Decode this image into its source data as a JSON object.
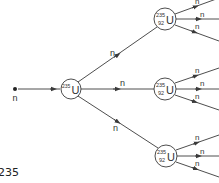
{
  "diagram": {
    "colors": {
      "line": "#3a3a3a",
      "text": "#333333",
      "background": "#ffffff"
    },
    "incoming_neutron": {
      "label": "n"
    },
    "primary_nucleus": {
      "mass": "235",
      "symbol": "U"
    },
    "branch_labels": [
      "n",
      "n",
      "n"
    ],
    "secondary_nuclei": [
      {
        "mass": "235",
        "atomic": "92",
        "symbol": "U",
        "out_labels": [
          "n",
          "n",
          "n"
        ]
      },
      {
        "mass": "235",
        "atomic": "92",
        "symbol": "U",
        "out_labels": [
          "n",
          "n",
          "n"
        ]
      },
      {
        "mass": "235",
        "atomic": "92",
        "symbol": "U",
        "out_labels": [
          "n",
          "n",
          "n"
        ]
      }
    ],
    "caption": "235"
  }
}
